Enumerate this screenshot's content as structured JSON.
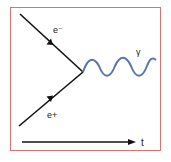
{
  "diagram": {
    "type": "feynman",
    "frame_color": "#e07070",
    "particles": {
      "electron": {
        "label": "e⁻",
        "color": "#111111"
      },
      "positron": {
        "label": "e+",
        "color": "#111111"
      },
      "photon": {
        "label": "γ",
        "color": "#5a74b0"
      }
    },
    "time_axis": {
      "label": "t"
    }
  }
}
